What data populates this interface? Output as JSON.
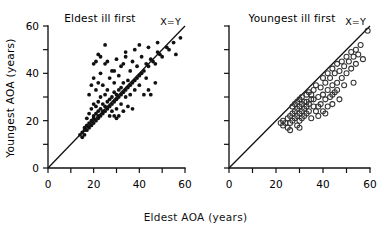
{
  "figure": {
    "x_axis_label": "Eldest AOA (years)",
    "y_axis_label": "Youngest AOA (years)",
    "reference_line_label": "X=Y",
    "tick_labels": [
      "0",
      "20",
      "40",
      "60"
    ],
    "colors": {
      "ink": "#111111",
      "background": "#ffffff",
      "open_marker_stroke": "#333333"
    }
  },
  "chart_data": [
    {
      "type": "scatter",
      "title": "Eldest ill first",
      "xlabel": "Eldest AOA (years)",
      "ylabel": "Youngest AOA (years)",
      "xlim": [
        0,
        60
      ],
      "ylim": [
        0,
        60
      ],
      "xticks": [
        0,
        10,
        20,
        30,
        40,
        50,
        60
      ],
      "yticks": [
        0,
        10,
        20,
        30,
        40,
        50,
        60
      ],
      "xtick_labels": [
        "0",
        "",
        "20",
        "",
        "40",
        "",
        "60"
      ],
      "ytick_labels": [
        "0",
        "",
        "20",
        "",
        "40",
        "",
        "60"
      ],
      "grid": false,
      "legend": "none",
      "marker": "filled-circle",
      "annotations": [
        {
          "text": "X=Y",
          "x": 52,
          "y": 60,
          "describes": "identity reference line"
        }
      ],
      "reference_line": {
        "type": "identity",
        "from": [
          0,
          0
        ],
        "to": [
          60,
          60
        ],
        "label": "X=Y"
      },
      "points": [
        [
          14,
          14
        ],
        [
          15,
          15
        ],
        [
          15,
          13
        ],
        [
          16,
          16
        ],
        [
          16,
          14
        ],
        [
          16,
          17
        ],
        [
          17,
          16
        ],
        [
          17,
          18
        ],
        [
          17,
          21
        ],
        [
          18,
          17
        ],
        [
          18,
          19
        ],
        [
          18,
          23
        ],
        [
          18,
          31
        ],
        [
          19,
          18
        ],
        [
          19,
          20
        ],
        [
          19,
          25
        ],
        [
          19,
          35
        ],
        [
          20,
          19
        ],
        [
          20,
          21
        ],
        [
          20,
          22
        ],
        [
          20,
          27
        ],
        [
          20,
          38
        ],
        [
          20,
          44
        ],
        [
          21,
          20
        ],
        [
          21,
          23
        ],
        [
          21,
          26
        ],
        [
          21,
          33
        ],
        [
          22,
          21
        ],
        [
          22,
          22
        ],
        [
          22,
          24
        ],
        [
          22,
          28
        ],
        [
          22,
          36
        ],
        [
          22,
          48
        ],
        [
          23,
          22
        ],
        [
          23,
          25
        ],
        [
          23,
          30
        ],
        [
          23,
          40
        ],
        [
          24,
          23
        ],
        [
          24,
          24
        ],
        [
          24,
          27
        ],
        [
          24,
          35
        ],
        [
          25,
          24
        ],
        [
          25,
          26
        ],
        [
          25,
          31
        ],
        [
          25,
          52
        ],
        [
          26,
          25
        ],
        [
          26,
          28
        ],
        [
          26,
          33
        ],
        [
          26,
          45
        ],
        [
          27,
          26
        ],
        [
          27,
          29
        ],
        [
          27,
          22
        ],
        [
          27,
          38
        ],
        [
          28,
          27
        ],
        [
          28,
          30
        ],
        [
          28,
          24
        ],
        [
          28,
          41
        ],
        [
          29,
          28
        ],
        [
          29,
          32
        ],
        [
          29,
          22
        ],
        [
          29,
          36
        ],
        [
          30,
          29
        ],
        [
          30,
          31
        ],
        [
          30,
          25
        ],
        [
          30,
          46
        ],
        [
          31,
          30
        ],
        [
          31,
          33
        ],
        [
          31,
          22
        ],
        [
          31,
          39
        ],
        [
          32,
          31
        ],
        [
          32,
          34
        ],
        [
          32,
          27
        ],
        [
          32,
          43
        ],
        [
          33,
          32
        ],
        [
          33,
          36
        ],
        [
          33,
          24
        ],
        [
          34,
          33
        ],
        [
          34,
          30
        ],
        [
          34,
          47
        ],
        [
          35,
          34
        ],
        [
          35,
          37
        ],
        [
          35,
          26
        ],
        [
          36,
          35
        ],
        [
          36,
          41
        ],
        [
          36,
          31
        ],
        [
          37,
          36
        ],
        [
          37,
          45
        ],
        [
          38,
          37
        ],
        [
          38,
          33
        ],
        [
          38,
          50
        ],
        [
          39,
          38
        ],
        [
          39,
          43
        ],
        [
          40,
          39
        ],
        [
          40,
          35
        ],
        [
          41,
          40
        ],
        [
          41,
          47
        ],
        [
          42,
          41
        ],
        [
          42,
          31
        ],
        [
          43,
          44
        ],
        [
          44,
          43
        ],
        [
          44,
          33
        ],
        [
          45,
          46
        ],
        [
          46,
          45
        ],
        [
          47,
          44
        ],
        [
          48,
          49
        ],
        [
          49,
          48
        ],
        [
          50,
          47
        ],
        [
          52,
          51
        ],
        [
          53,
          50
        ],
        [
          55,
          53
        ],
        [
          56,
          48
        ],
        [
          58,
          55
        ],
        [
          45,
          31
        ],
        [
          37,
          25
        ],
        [
          33,
          44
        ],
        [
          29,
          41
        ],
        [
          25,
          44
        ],
        [
          21,
          45
        ],
        [
          23,
          47
        ],
        [
          34,
          49
        ],
        [
          40,
          52
        ],
        [
          44,
          51
        ],
        [
          48,
          53
        ],
        [
          43,
          38
        ],
        [
          47,
          36
        ],
        [
          30,
          21
        ]
      ]
    },
    {
      "type": "scatter",
      "title": "Youngest ill first",
      "xlabel": "Eldest AOA (years)",
      "ylabel": "Youngest AOA (years)",
      "xlim": [
        0,
        60
      ],
      "ylim": [
        0,
        60
      ],
      "xticks": [
        0,
        10,
        20,
        30,
        40,
        50,
        60
      ],
      "yticks": [
        0,
        10,
        20,
        30,
        40,
        50,
        60
      ],
      "xtick_labels": [
        "0",
        "",
        "20",
        "",
        "40",
        "",
        "60"
      ],
      "ytick_labels": [
        "",
        "",
        "",
        "",
        "",
        "",
        ""
      ],
      "grid": false,
      "legend": "none",
      "marker": "open-circle",
      "annotations": [
        {
          "text": "X=Y",
          "x": 52,
          "y": 60,
          "describes": "identity reference line"
        }
      ],
      "reference_line": {
        "type": "identity",
        "from": [
          0,
          0
        ],
        "to": [
          60,
          60
        ],
        "label": "X=Y"
      },
      "points": [
        [
          22,
          19
        ],
        [
          23,
          18
        ],
        [
          23,
          20
        ],
        [
          24,
          19
        ],
        [
          25,
          21
        ],
        [
          25,
          17
        ],
        [
          26,
          22
        ],
        [
          26,
          19
        ],
        [
          27,
          23
        ],
        [
          27,
          20
        ],
        [
          27,
          26
        ],
        [
          28,
          24
        ],
        [
          28,
          21
        ],
        [
          28,
          27
        ],
        [
          29,
          25
        ],
        [
          29,
          22
        ],
        [
          29,
          28
        ],
        [
          29,
          18
        ],
        [
          30,
          26
        ],
        [
          30,
          23
        ],
        [
          30,
          29
        ],
        [
          30,
          20
        ],
        [
          31,
          27
        ],
        [
          31,
          24
        ],
        [
          31,
          30
        ],
        [
          32,
          28
        ],
        [
          32,
          25
        ],
        [
          32,
          22
        ],
        [
          33,
          26
        ],
        [
          33,
          31
        ],
        [
          33,
          23
        ],
        [
          34,
          27
        ],
        [
          34,
          24
        ],
        [
          35,
          29
        ],
        [
          35,
          21
        ],
        [
          36,
          33
        ],
        [
          36,
          26
        ],
        [
          37,
          35
        ],
        [
          37,
          24
        ],
        [
          38,
          30
        ],
        [
          38,
          22
        ],
        [
          39,
          34
        ],
        [
          39,
          27
        ],
        [
          40,
          38
        ],
        [
          40,
          31
        ],
        [
          40,
          24
        ],
        [
          41,
          36
        ],
        [
          41,
          29
        ],
        [
          42,
          40
        ],
        [
          42,
          33
        ],
        [
          42,
          26
        ],
        [
          43,
          38
        ],
        [
          43,
          30
        ],
        [
          44,
          42
        ],
        [
          44,
          35
        ],
        [
          44,
          27
        ],
        [
          45,
          40
        ],
        [
          45,
          32
        ],
        [
          46,
          44
        ],
        [
          46,
          36
        ],
        [
          47,
          41
        ],
        [
          47,
          29
        ],
        [
          48,
          45
        ],
        [
          48,
          38
        ],
        [
          49,
          43
        ],
        [
          50,
          47
        ],
        [
          50,
          40
        ],
        [
          51,
          45
        ],
        [
          52,
          49
        ],
        [
          52,
          42
        ],
        [
          53,
          47
        ],
        [
          53,
          36
        ],
        [
          54,
          50
        ],
        [
          54,
          44
        ],
        [
          55,
          48
        ],
        [
          56,
          52
        ],
        [
          57,
          46
        ],
        [
          59,
          58
        ],
        [
          35,
          31
        ],
        [
          33,
          28
        ],
        [
          31,
          21
        ],
        [
          36,
          29
        ],
        [
          38,
          26
        ],
        [
          34,
          32
        ],
        [
          46,
          33
        ],
        [
          49,
          35
        ],
        [
          44,
          31
        ],
        [
          41,
          23
        ],
        [
          30,
          17
        ],
        [
          26,
          16
        ]
      ]
    }
  ]
}
